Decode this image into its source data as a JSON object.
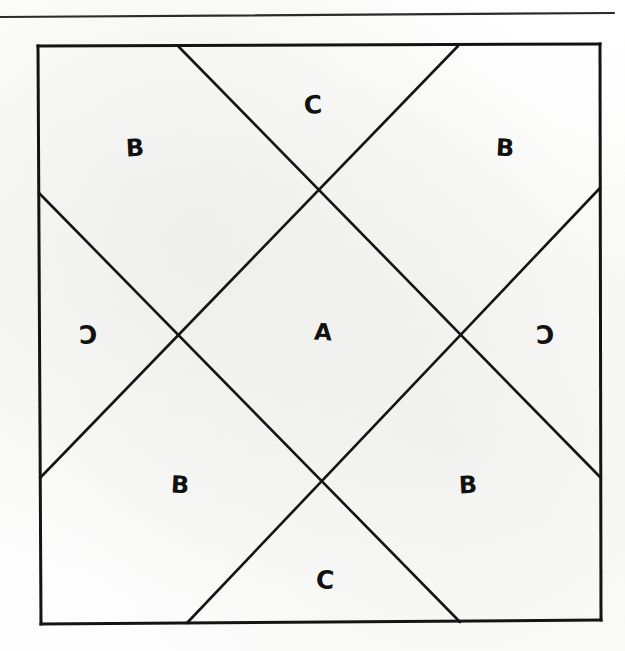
{
  "page": {
    "width": 625,
    "height": 651,
    "background_color": "#fdfdfc",
    "ink_color": "#111111"
  },
  "rule": {
    "name": "horizontal-rule",
    "y": 15,
    "x_start": 0,
    "x_end": 614,
    "thickness": 2
  },
  "figure": {
    "square": {
      "left": 38,
      "top": 45,
      "right": 600,
      "bottom": 624
    },
    "diagonals": [
      {
        "name": "diag-tl-down-right",
        "x1": 178,
        "y1": 45,
        "x2": 600,
        "y2": 478
      },
      {
        "name": "diag-tr-down-left",
        "x1": 458,
        "y1": 45,
        "x2": 40,
        "y2": 478
      },
      {
        "name": "diag-lt-down-right",
        "x1": 38,
        "y1": 193,
        "x2": 460,
        "y2": 624
      },
      {
        "name": "diag-rt-down-left",
        "x1": 600,
        "y1": 188,
        "x2": 187,
        "y2": 624
      }
    ],
    "intersections": [
      {
        "name": "node-top",
        "x": 318,
        "y": 192
      },
      {
        "name": "node-left",
        "x": 183,
        "y": 335
      },
      {
        "name": "node-right",
        "x": 458,
        "y": 332
      },
      {
        "name": "node-bottom",
        "x": 322,
        "y": 475
      }
    ]
  },
  "labels": [
    {
      "id": "label-a-center",
      "text": "A",
      "x": 323,
      "y": 332,
      "size": "a",
      "style": "skew-r"
    },
    {
      "id": "label-b-top-left",
      "text": "B",
      "x": 135,
      "y": 148,
      "size": "b",
      "style": "skew-l"
    },
    {
      "id": "label-b-top-right",
      "text": "B",
      "x": 505,
      "y": 148,
      "size": "b",
      "style": "skew-r"
    },
    {
      "id": "label-b-bottom-left",
      "text": "B",
      "x": 180,
      "y": 485,
      "size": "b",
      "style": "skew-r"
    },
    {
      "id": "label-b-bottom-right",
      "text": "B",
      "x": 468,
      "y": 485,
      "size": "b",
      "style": "skew-l"
    },
    {
      "id": "label-c-top",
      "text": "C",
      "x": 313,
      "y": 105,
      "size": "c",
      "style": "skew-l"
    },
    {
      "id": "label-c-left",
      "text": "C",
      "x": 88,
      "y": 335,
      "size": "c",
      "style": "flip-c"
    },
    {
      "id": "label-c-right",
      "text": "C",
      "x": 545,
      "y": 335,
      "size": "c",
      "style": "flip-c"
    },
    {
      "id": "label-c-bottom",
      "text": "C",
      "x": 325,
      "y": 580,
      "size": "c",
      "style": "skew-r"
    }
  ]
}
